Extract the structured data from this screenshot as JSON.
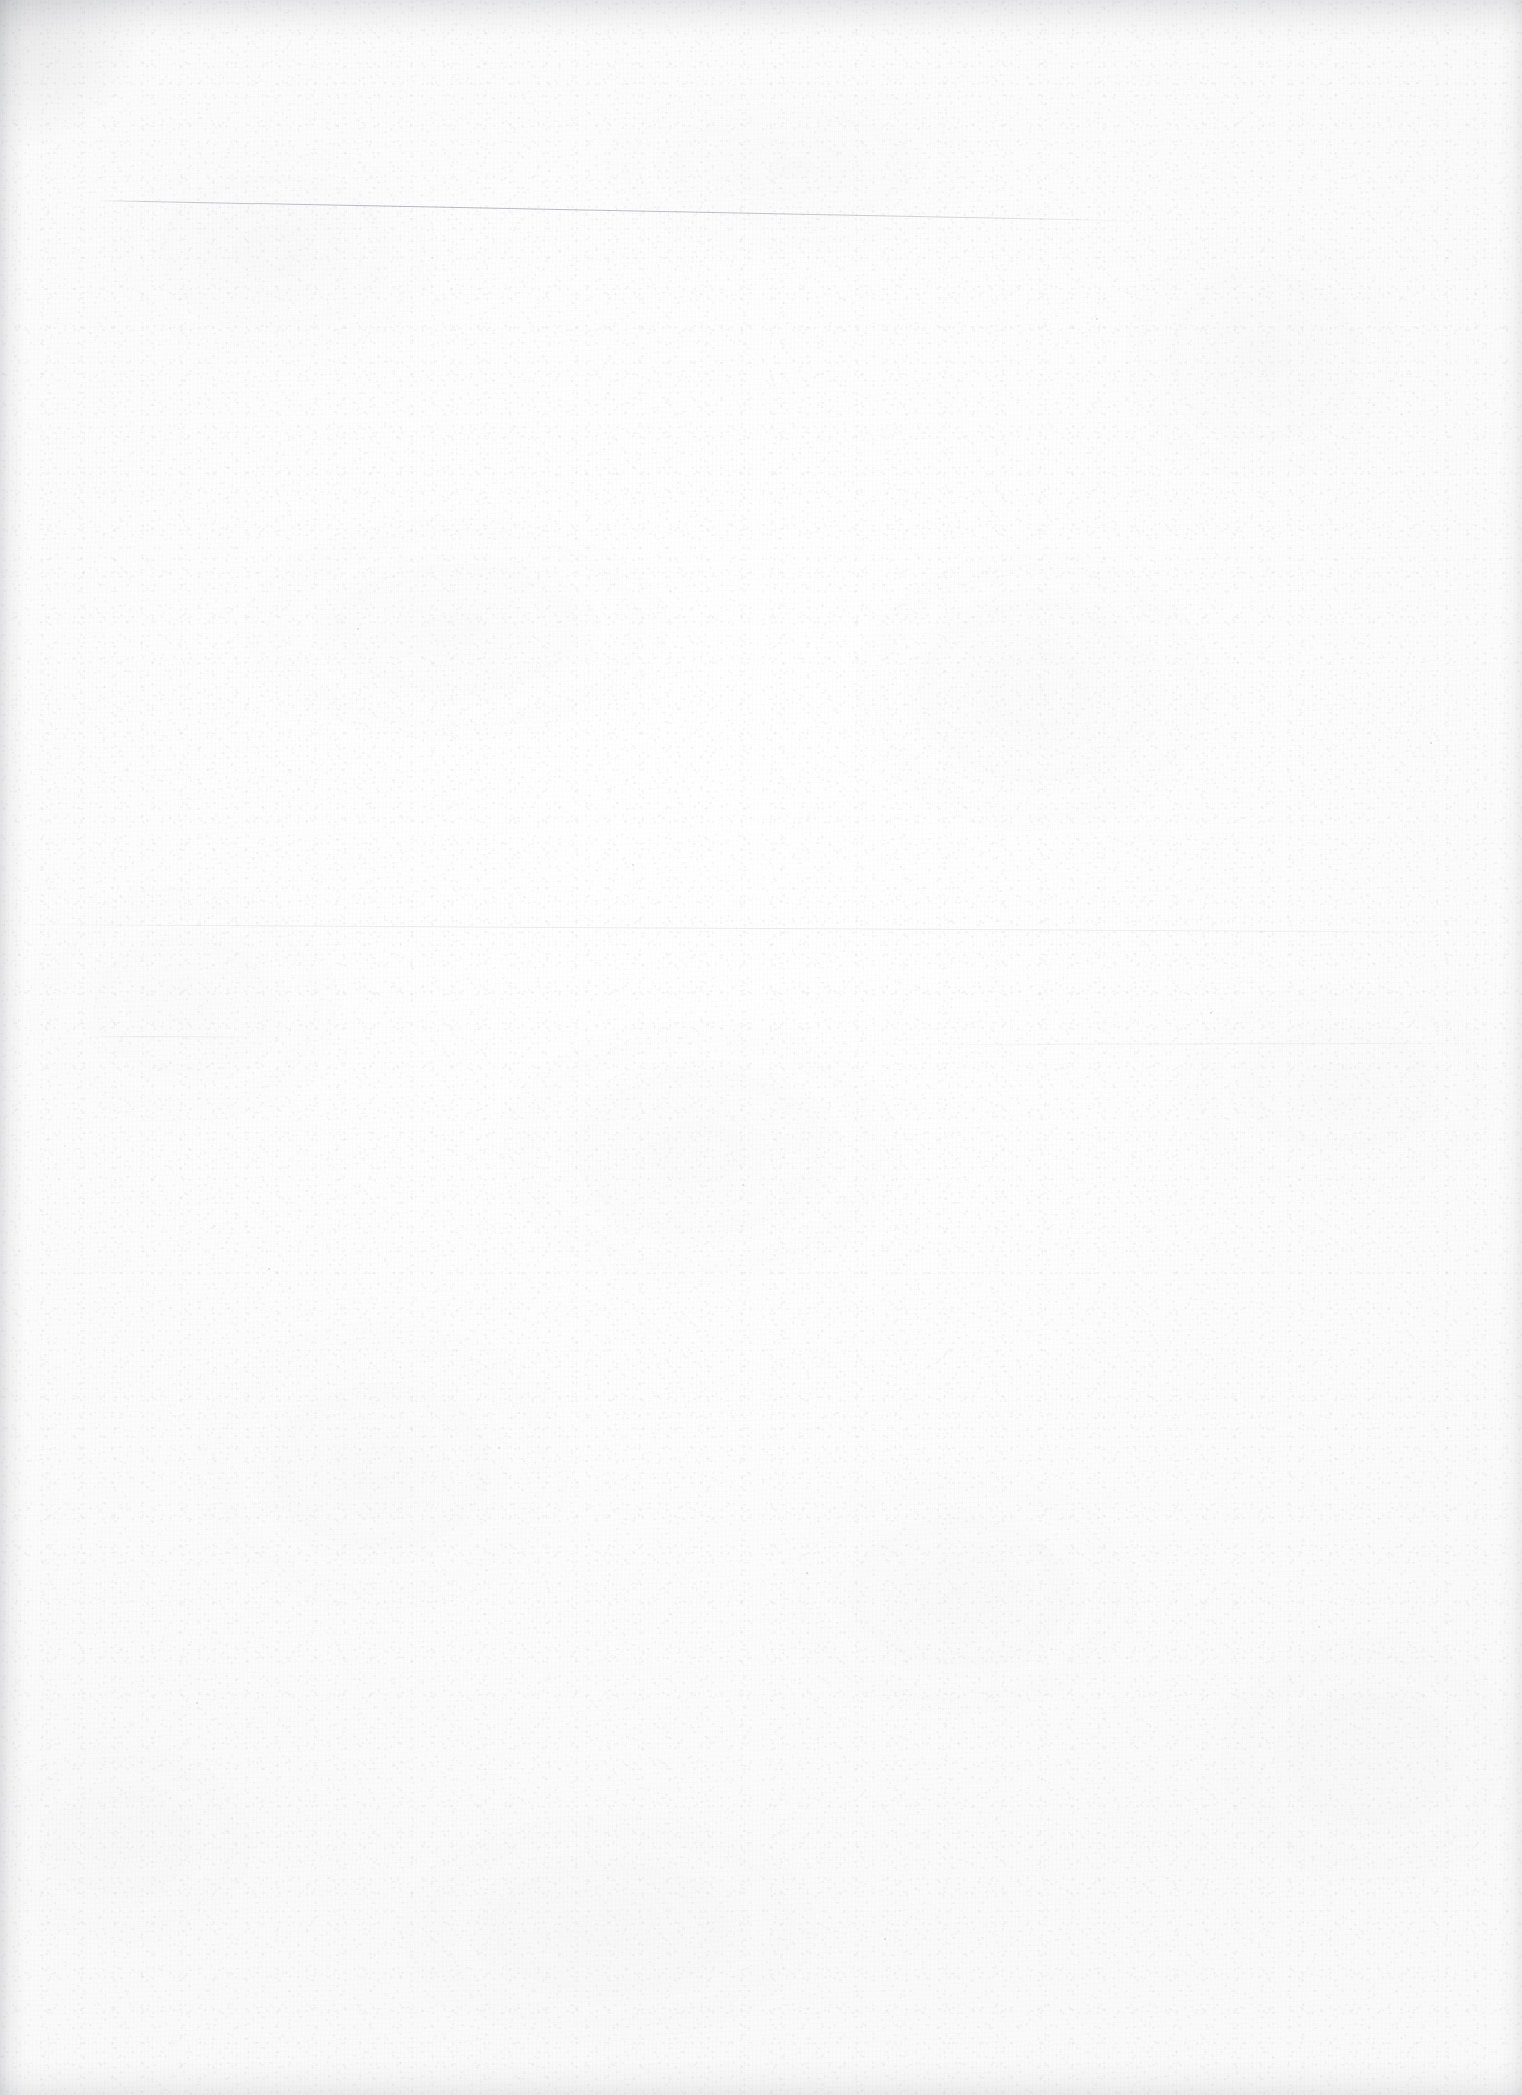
{
  "document": {
    "kind": "scanned-page",
    "page_state": "blank",
    "visible_text": "",
    "page_width_px": 1522,
    "page_height_px": 2095,
    "orientation": "portrait",
    "background_color": "#fdfdfd",
    "paper_tone_color": "#fafafa",
    "grain_color": "#969aa0",
    "edge_shadow_color": "#787a82"
  },
  "marks": {
    "rule_lines": [
      {
        "name": "primary-rule-line",
        "description": "faint slanted horizontal line near top of page",
        "x_start": 95,
        "y_start": 200,
        "length": 1050,
        "angle_deg": 1.12,
        "color": "#666a78",
        "opacity": 0.46
      },
      {
        "name": "secondary-rule-line",
        "description": "very faint full-width horizontal tone break in mid page",
        "x_start": 0,
        "y_start": 924,
        "length": 1522,
        "angle_deg": 0.3,
        "color": "#8e919c",
        "opacity": 0.18
      },
      {
        "name": "tertiary-rule-line",
        "description": "short faint segment at left margin below mid page",
        "x_start": 88,
        "y_start": 1036,
        "length": 168,
        "angle_deg": 0.2,
        "color": "#9498a0",
        "opacity": 0.17
      },
      {
        "name": "quaternary-rule-line",
        "description": "faint segment along right side below mid page",
        "x_start": 880,
        "y_start": 1044,
        "length": 642,
        "angle_deg": -0.12,
        "color": "#9698a4",
        "opacity": 0.13
      }
    ],
    "edges": [
      {
        "name": "top-edge-shadow",
        "side": "top",
        "thickness_px": 42
      },
      {
        "name": "left-edge-shadow",
        "side": "left",
        "thickness_px": 26
      },
      {
        "name": "right-edge-shadow",
        "side": "right",
        "thickness_px": 22
      },
      {
        "name": "bottom-edge-shadow",
        "side": "bottom",
        "thickness_px": 34
      }
    ],
    "specks": [
      {
        "x": 357,
        "y": 628,
        "size": 2.0
      },
      {
        "x": 742,
        "y": 1184,
        "size": 2.4
      },
      {
        "x": 1096,
        "y": 318,
        "size": 1.8
      },
      {
        "x": 498,
        "y": 1447,
        "size": 2.1
      },
      {
        "x": 1318,
        "y": 1626,
        "size": 1.9
      },
      {
        "x": 196,
        "y": 1702,
        "size": 2.2
      },
      {
        "x": 884,
        "y": 1938,
        "size": 1.7
      },
      {
        "x": 632,
        "y": 864,
        "size": 1.6
      },
      {
        "x": 1210,
        "y": 1012,
        "size": 2.0
      },
      {
        "x": 268,
        "y": 1268,
        "size": 1.8
      },
      {
        "x": 1430,
        "y": 742,
        "size": 1.7
      },
      {
        "x": 806,
        "y": 1572,
        "size": 2.0
      }
    ]
  }
}
